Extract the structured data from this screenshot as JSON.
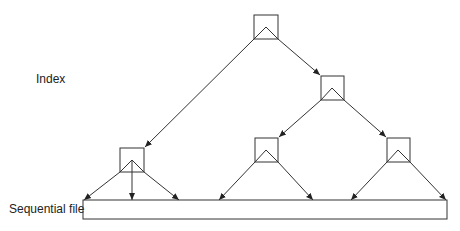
{
  "labels": {
    "index": "Index",
    "sequential_file": "Sequential file"
  }
}
